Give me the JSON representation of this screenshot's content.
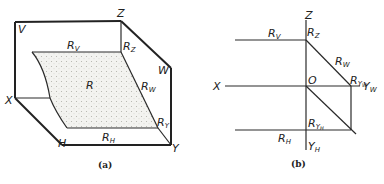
{
  "figure_a": {
    "caption": "(a)",
    "labels": {
      "V": "V",
      "Z": "Z",
      "W": "W",
      "X": "X",
      "H": "H",
      "Y": "Y",
      "R": "R",
      "Rv": "R",
      "Rv_sub": "V",
      "Rz": "R",
      "Rz_sub": "Z",
      "Rw": "R",
      "Rw_sub": "W",
      "Ry": "R",
      "Ry_sub": "Y",
      "Rh": "R",
      "Rh_sub": "H"
    },
    "fill_color": "#f1f1ee",
    "dot_color": "#b8b8b0"
  },
  "figure_b": {
    "caption": "(b)",
    "labels": {
      "Z": "Z",
      "X": "X",
      "O": "O",
      "Rv": "R",
      "Rv_sub": "V",
      "Rz": "R",
      "Rz_sub": "Z",
      "Rw": "R",
      "Rw_sub": "W",
      "Ryw": "R",
      "Ryw_sub": "Y",
      "Ryw_sub2": "W",
      "Yw": "Y",
      "Yw_sub": "W",
      "Ryh": "R",
      "Ryh_sub": "Y",
      "Ryh_sub2": "H",
      "Rh": "R",
      "Rh_sub": "H",
      "Yh": "Y",
      "Yh_sub": "H"
    }
  }
}
